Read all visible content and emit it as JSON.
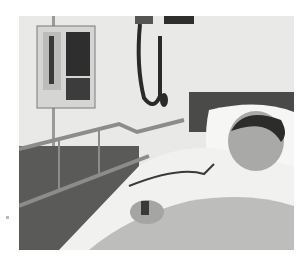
{
  "image": {
    "description": "Black and white photograph of a boy lying in a hospital bed with an IV pump, wall-mounted blood pressure cuff, bed rails and a pulse oximeter clip on his finger",
    "subjects": [
      "boy",
      "hospital bed",
      "pillow",
      "blanket",
      "IV infusion pump",
      "wall blood pressure monitor",
      "bed rail",
      "pulse oximeter"
    ],
    "palette": {
      "wall": "#e9e9e7",
      "dark": "#2a2a2a",
      "mid": "#8a8a8a",
      "sheet": "#f2f2f0",
      "blanket": "#bdbdbb",
      "skin": "#a9a9a7"
    }
  }
}
